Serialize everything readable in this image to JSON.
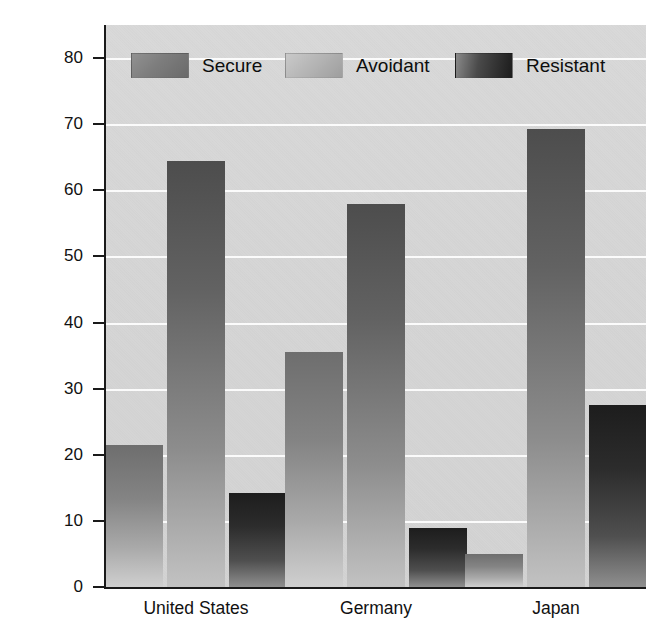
{
  "chart_data": {
    "type": "bar",
    "title": "",
    "subtitle": "",
    "xlabel": "",
    "ylabel": "Percentage of infants",
    "categories": [
      "United States",
      "Germany",
      "Japan"
    ],
    "series": [
      {
        "name": "Secure",
        "values": [
          21.5,
          35.5,
          5.0
        ],
        "color": "#7d7d7d"
      },
      {
        "name": "Avoidant",
        "values": [
          64.5,
          58.0,
          69.3
        ],
        "color": "#b4b4b4"
      },
      {
        "name": "Resistant",
        "values": [
          14.2,
          9.0,
          27.5
        ],
        "color": "#2c2c2c"
      }
    ],
    "ylim": [
      0,
      85
    ],
    "yticks": [
      0,
      10,
      20,
      30,
      40,
      50,
      60,
      70,
      80
    ],
    "ytick_labels": [
      "0",
      "10",
      "20",
      "30",
      "40",
      "50",
      "60",
      "70",
      "80"
    ],
    "grid": true,
    "grid_color": "#fdfdfd",
    "legend_position": "top-inside",
    "plot_background": "#d6d6d6",
    "axis_color": "#1a1a1a"
  },
  "legend": {
    "items": [
      {
        "label": "Secure",
        "swatch": "secure-swatch"
      },
      {
        "label": "Avoidant",
        "swatch": "avoidant-swatch"
      },
      {
        "label": "Resistant",
        "swatch": "resistant-swatch"
      }
    ]
  },
  "axis": {
    "y_title": "Percentage of infants"
  }
}
